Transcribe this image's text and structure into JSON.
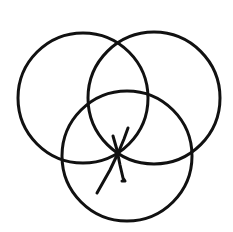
{
  "diagram": {
    "background": "#ffffff",
    "stroke_color": "#111111",
    "stroke_width": 3,
    "circles": [
      {
        "name": "left",
        "cx": 83,
        "cy": 98,
        "r": 65
      },
      {
        "name": "right",
        "cx": 154,
        "cy": 98,
        "r": 66
      },
      {
        "name": "bottom",
        "cx": 127,
        "cy": 156,
        "r": 65
      }
    ],
    "strokes": [
      {
        "name": "long-diagonal",
        "points": "97,193 110,170 119,151 124,139 128,128"
      },
      {
        "name": "short-tick",
        "points": "113,136 117,150 120,165 123,178 125,181 122,181"
      }
    ]
  }
}
